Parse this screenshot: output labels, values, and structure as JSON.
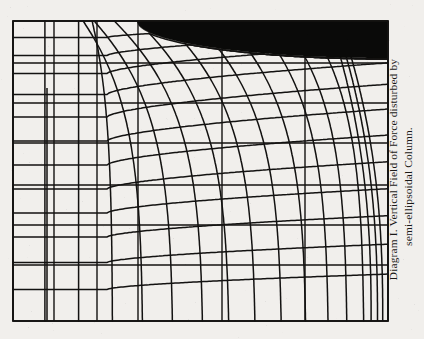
{
  "figure": {
    "caption_line1": "Diagram I.   Vertical Field of Force disturbed by",
    "caption_line2": "semi-ellipsoidal Column.",
    "caption_full": "Diagram I. Vertical Field of Force disturbed by semi-ellipsoidal Column.",
    "label": "Diagram I.",
    "title": "Vertical Field of Force disturbed by semi-ellipsoidal Column.",
    "margin_bleed_top": "",
    "margin_bleed_bottom": ""
  },
  "colors": {
    "paper": "#f1efec",
    "ink": "#131211",
    "body_fill": "#0a0a09",
    "bleed": "#cbc7c2"
  },
  "chart_data": {
    "type": "line",
    "title": "Vertical Field of Force disturbed by semi-ellipsoidal Column.",
    "subtitle": "Diagram I.",
    "xlabel": "",
    "ylabel": "",
    "grid": true,
    "legend": null,
    "frame": {
      "x0": 13,
      "y0": 21,
      "x1": 388,
      "y1": 321
    },
    "xlim": [
      0,
      1
    ],
    "ylim": [
      0,
      1
    ],
    "body": {
      "shape": "semi-ellipse",
      "fill": "#0a0a09",
      "apex_x": 137,
      "top_y": 21,
      "right_x": 388,
      "base_y": 58,
      "semi_axis_a": 251,
      "semi_axis_b": 37
    },
    "series": [
      {
        "name": "lines of force (vertical, distorted)",
        "kind": "flux-lines",
        "count": 13,
        "x_starts": [
          0.085,
          0.175,
          0.265,
          0.345,
          0.425,
          0.505,
          0.575,
          0.645,
          0.715,
          0.78,
          0.84,
          0.89,
          0.935
        ]
      },
      {
        "name": "equipotential surfaces (horizontal, distorted)",
        "kind": "equipotentials",
        "count": 12,
        "y_levels": [
          0.055,
          0.115,
          0.175,
          0.245,
          0.32,
          0.4,
          0.48,
          0.56,
          0.64,
          0.72,
          0.805,
          0.895
        ]
      },
      {
        "name": "undisturbed rectangular reference grid",
        "kind": "reference-grid",
        "x_gridlines": [
          13,
          54,
          97,
          138,
          222,
          305,
          388
        ],
        "y_gridlines": [
          21,
          63,
          103,
          143,
          185,
          225,
          265,
          321
        ]
      }
    ]
  }
}
